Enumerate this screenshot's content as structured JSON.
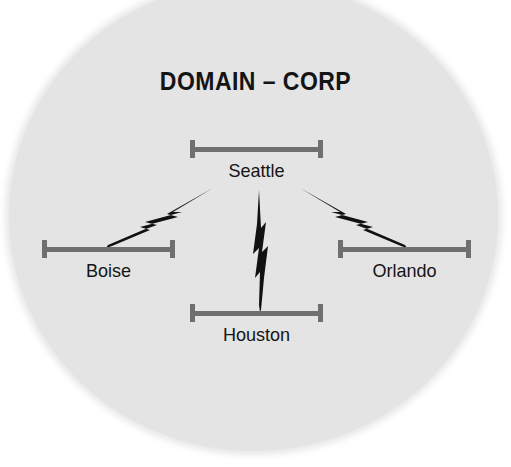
{
  "diagram": {
    "title": "DOMAIN – CORP",
    "background_shape": "circle",
    "colors": {
      "disc_fill": "#e4e4e4",
      "page_background": "#ffffff",
      "segment_gray": "#6f6f6f",
      "link_black": "#111111",
      "text_black": "#151515"
    },
    "nodes": [
      {
        "id": "seattle",
        "label": "Seattle",
        "icon": "network-segment-icon",
        "position": "top-center"
      },
      {
        "id": "boise",
        "label": "Boise",
        "icon": "network-segment-icon",
        "position": "middle-left"
      },
      {
        "id": "orlando",
        "label": "Orlando",
        "icon": "network-segment-icon",
        "position": "middle-right"
      },
      {
        "id": "houston",
        "label": "Houston",
        "icon": "network-segment-icon",
        "position": "bottom-center"
      }
    ],
    "links": [
      {
        "id": "seattle-boise",
        "from": "seattle",
        "to": "boise",
        "icon": "lightning-bolt-link-icon",
        "style": "wan-lightning"
      },
      {
        "id": "seattle-houston",
        "from": "seattle",
        "to": "houston",
        "icon": "lightning-bolt-link-icon",
        "style": "wan-lightning"
      },
      {
        "id": "seattle-orlando",
        "from": "seattle",
        "to": "orlando",
        "icon": "lightning-bolt-link-icon",
        "style": "wan-lightning"
      }
    ]
  }
}
